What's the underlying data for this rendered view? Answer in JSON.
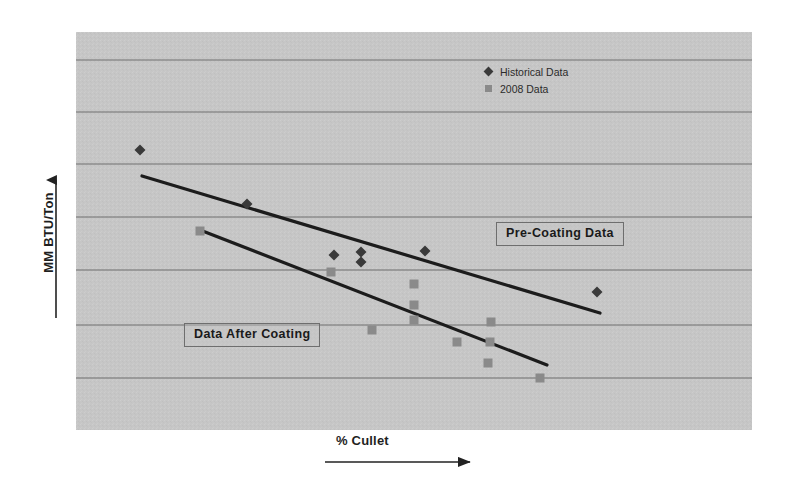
{
  "chart_data": {
    "type": "scatter",
    "title": "",
    "xlabel": "% Cullet",
    "ylabel": "MM BTU/Ton",
    "grid": true,
    "xlim": [
      0,
      100
    ],
    "ylim": [
      0,
      100
    ],
    "xticklabels": [],
    "yticklabels": [],
    "gridlines_y": [
      60,
      112,
      164,
      217,
      270,
      325,
      378
    ],
    "plot_area": {
      "x": 76,
      "y": 32,
      "width": 676,
      "height": 398
    },
    "plot_background": "#c8c8c8",
    "grid_color": "#6f6f6f",
    "legend": {
      "position": "top-right-inside",
      "entries": [
        {
          "name": "Historical Data",
          "marker": "diamond",
          "color": "#3a3a3a"
        },
        {
          "name": "2008 Data",
          "marker": "square",
          "color": "#8a8a8a"
        }
      ]
    },
    "series": [
      {
        "name": "Historical Data",
        "marker": "diamond",
        "color": "#3a3a3a",
        "points": [
          {
            "x": 140,
            "y": 150
          },
          {
            "x": 247,
            "y": 204
          },
          {
            "x": 334,
            "y": 255
          },
          {
            "x": 361,
            "y": 252
          },
          {
            "x": 361,
            "y": 262
          },
          {
            "x": 425,
            "y": 251
          },
          {
            "x": 597,
            "y": 292
          }
        ]
      },
      {
        "name": "2008 Data",
        "marker": "square",
        "color": "#8a8a8a",
        "points": [
          {
            "x": 200,
            "y": 231
          },
          {
            "x": 331,
            "y": 272
          },
          {
            "x": 372,
            "y": 330
          },
          {
            "x": 414,
            "y": 284
          },
          {
            "x": 414,
            "y": 305
          },
          {
            "x": 414,
            "y": 320
          },
          {
            "x": 457,
            "y": 342
          },
          {
            "x": 491,
            "y": 322
          },
          {
            "x": 490,
            "y": 342
          },
          {
            "x": 488,
            "y": 363
          },
          {
            "x": 540,
            "y": 378
          }
        ]
      }
    ],
    "trendlines": [
      {
        "name": "Pre-Coating trend",
        "color": "#1c1c1c",
        "x1": 142,
        "y1": 176,
        "x2": 600,
        "y2": 313
      },
      {
        "name": "Post-Coating trend",
        "color": "#1c1c1c",
        "x1": 200,
        "y1": 230,
        "x2": 547,
        "y2": 365
      }
    ],
    "annotations": [
      {
        "text": "Pre-Coating Data",
        "x": 496,
        "y": 222,
        "boxed": true
      },
      {
        "text": "Data After Coating",
        "x": 184,
        "y": 323,
        "boxed": true
      }
    ],
    "axis_arrows": {
      "y_arrow_direction": "up",
      "x_arrow_direction": "right"
    }
  }
}
